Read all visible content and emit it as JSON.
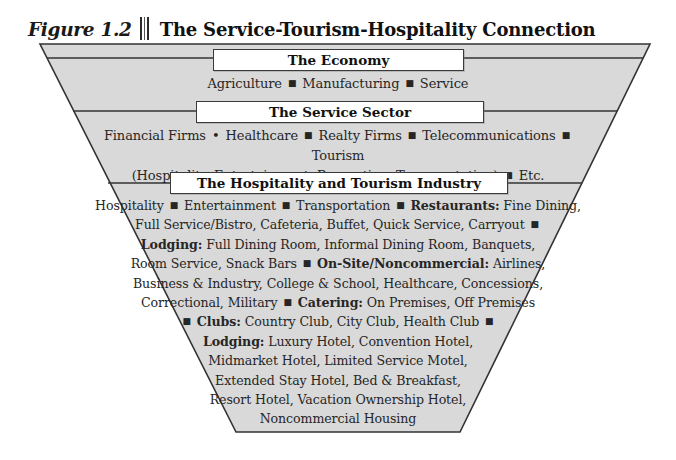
{
  "figure": {
    "number_label": "Figure 1.2",
    "title": "The Service-Tourism-Hospitality Connection"
  },
  "colors": {
    "funnel_fill": "#d9d9d9",
    "funnel_stroke": "#333333",
    "box_fill": "#ffffff",
    "box_stroke": "#3a3a3a",
    "text": "#262626"
  },
  "tiers": [
    {
      "id": "economy",
      "box_label": "The Economy",
      "lines": [
        "Agriculture ■ Manufacturing ■ Service"
      ]
    },
    {
      "id": "service-sector",
      "box_label": "The Service Sector",
      "lines": [
        "Financial Firms • Healthcare ■ Realty Firms ■ Telecommunications ■ Tourism",
        "(Hospitality, Entertainment, Recreation, Transportation) ■ Etc."
      ]
    },
    {
      "id": "hospitality-tourism",
      "box_label": "The Hospitality and Tourism Industry",
      "lines": [
        "Hospitality ■ Entertainment ■ Transportation ■ Restaurants: Fine Dining,",
        "Full Service/Bistro, Cafeteria, Buffet, Quick Service, Carryout ■",
        "Lodging: Full Dining Room, Informal Dining Room, Banquets,",
        "Room Service, Snack Bars ■ On-Site/Noncommercial: Airlines,",
        "Business & Industry, College & School, Healthcare, Concessions,",
        "Correctional, Military ■ Catering: On Premises, Off Premises",
        "■ Clubs: Country Club, City Club, Health Club ■",
        "Lodging: Luxury Hotel, Convention Hotel,",
        "Midmarket Hotel, Limited Service Motel,",
        "Extended Stay Hotel, Bed & Breakfast,",
        "Resort Hotel, Vacation Ownership Hotel,",
        "Noncommercial Housing"
      ],
      "emphasis_terms": [
        "Restaurants:",
        "Lodging:",
        "On-Site/Noncommercial:",
        "Catering:",
        "Clubs:"
      ]
    }
  ]
}
